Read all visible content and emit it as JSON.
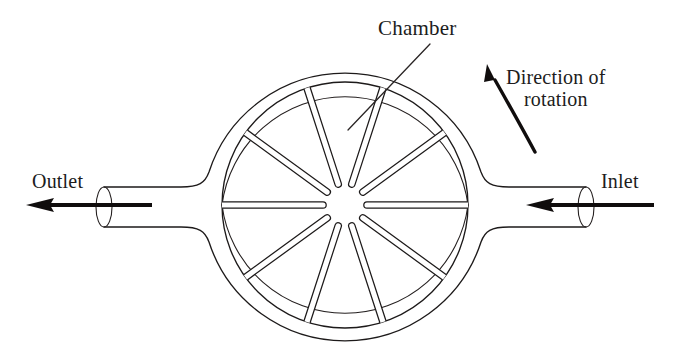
{
  "figure": {
    "background_color": "#ffffff",
    "line_color": "#1d1a1a",
    "width": 678,
    "height": 362
  },
  "labels": {
    "chamber": "Chamber",
    "direction_line1": "Direction of",
    "direction_line2": "rotation",
    "outlet": "Outlet",
    "inlet": "Inlet"
  },
  "geometry": {
    "center_x": 345,
    "center_y": 205,
    "casing_outer_radius": 143,
    "casing_inner_radius": 124,
    "rotor_radius": 123,
    "hub_radius": 22,
    "vane_count": 10,
    "vane_half_width": 3.2,
    "pipe_top_y": 187,
    "pipe_bottom_y": 227,
    "left_pipe_end_x": 96,
    "right_pipe_end_x": 594,
    "pipe_end_ellipse_rx": 8,
    "pipe_end_ellipse_ry": 20
  },
  "flow_arrows": {
    "outlet_arrow_direction": "left",
    "outlet_arrow_start_x": 148,
    "outlet_arrow_end_x": 28,
    "inlet_arrow_direction": "left",
    "inlet_arrow_start_x": 652,
    "inlet_arrow_end_x": 528,
    "arrow_y": 205
  },
  "rotation_arrow": {
    "direction": "counterclockwise",
    "arc_start": "bottom-right",
    "arc_end": "top-left"
  },
  "leader_lines": {
    "chamber_from_x": 430,
    "chamber_from_y": 44,
    "chamber_to_x": 348,
    "chamber_to_y": 128
  }
}
